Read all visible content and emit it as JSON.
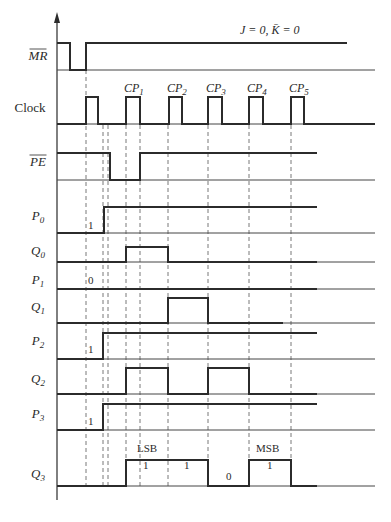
{
  "title_annotation": "J = 0, K̄ = 0",
  "signals": [
    {
      "id": "MR",
      "label": "MR",
      "sub": "",
      "overbar": true,
      "italic": true,
      "initial": 1,
      "transitions": [
        [
          70,
          0
        ],
        [
          86,
          1
        ]
      ],
      "end": 347,
      "annotation": ""
    },
    {
      "id": "Clock",
      "label": "Clock",
      "sub": "",
      "overbar": false,
      "italic": false,
      "initial": 0,
      "transitions": [
        [
          86,
          1
        ],
        [
          98,
          0
        ],
        [
          126,
          1
        ],
        [
          140,
          0
        ],
        [
          169,
          1
        ],
        [
          182,
          0
        ],
        [
          208,
          1
        ],
        [
          222,
          0
        ],
        [
          249,
          1
        ],
        [
          263,
          0
        ],
        [
          291,
          1
        ],
        [
          304,
          0
        ]
      ],
      "end": 375,
      "annotation": ""
    },
    {
      "id": "PE",
      "label": "PE",
      "sub": "",
      "overbar": true,
      "italic": true,
      "initial": 1,
      "transitions": [
        [
          110,
          0
        ],
        [
          140,
          1
        ]
      ],
      "end": 317,
      "annotation": ""
    },
    {
      "id": "P0",
      "label": "P",
      "sub": "0",
      "overbar": false,
      "italic": true,
      "initial": 0,
      "transitions": [
        [
          104,
          1
        ]
      ],
      "end": 317,
      "annotation": "1"
    },
    {
      "id": "Q0",
      "label": "Q",
      "sub": "0",
      "overbar": false,
      "italic": true,
      "initial": 0,
      "transitions": [
        [
          126,
          1
        ],
        [
          168,
          0
        ]
      ],
      "end": 317,
      "annotation": ""
    },
    {
      "id": "P1",
      "label": "P",
      "sub": "1",
      "overbar": false,
      "italic": true,
      "initial": 0,
      "transitions": [],
      "end": 317,
      "annotation": "0"
    },
    {
      "id": "Q1",
      "label": "Q",
      "sub": "1",
      "overbar": false,
      "italic": true,
      "initial": 0,
      "transitions": [
        [
          168,
          1
        ],
        [
          208,
          0
        ]
      ],
      "end": 283,
      "annotation": ""
    },
    {
      "id": "P2",
      "label": "P",
      "sub": "2",
      "overbar": false,
      "italic": true,
      "initial": 0,
      "transitions": [
        [
          103,
          1
        ]
      ],
      "end": 317,
      "annotation": "1"
    },
    {
      "id": "Q2",
      "label": "Q",
      "sub": "2",
      "overbar": false,
      "italic": true,
      "initial": 0,
      "transitions": [
        [
          126,
          1
        ],
        [
          168,
          0
        ],
        [
          208,
          1
        ],
        [
          249,
          0
        ]
      ],
      "end": 317,
      "annotation": ""
    },
    {
      "id": "P3",
      "label": "P",
      "sub": "3",
      "overbar": false,
      "italic": true,
      "initial": 0,
      "transitions": [
        [
          103,
          1
        ]
      ],
      "end": 317,
      "annotation": "1"
    },
    {
      "id": "Q3",
      "label": "Q",
      "sub": "3",
      "overbar": false,
      "italic": true,
      "initial": 0,
      "transitions": [
        [
          126,
          1
        ],
        [
          208,
          0
        ],
        [
          249,
          1
        ],
        [
          291,
          0
        ]
      ],
      "end": 317,
      "annotation": ""
    }
  ],
  "clock_pulses": [
    {
      "label": "CP",
      "sub": "1"
    },
    {
      "label": "CP",
      "sub": "2"
    },
    {
      "label": "CP",
      "sub": "3"
    },
    {
      "label": "CP",
      "sub": "4"
    },
    {
      "label": "CP",
      "sub": "5"
    }
  ],
  "q3_annotations": {
    "lsb": "LSB",
    "msb": "MSB",
    "bits": [
      "1",
      "1",
      "0",
      "1"
    ]
  },
  "colors": {
    "ink": "#2b2b2b",
    "background": "#ffffff"
  }
}
